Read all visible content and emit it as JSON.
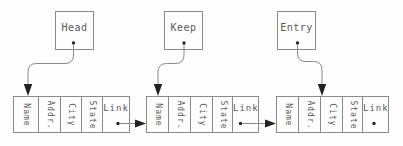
{
  "diagram": {
    "pointers": [
      {
        "label": "Head"
      },
      {
        "label": "Keep"
      },
      {
        "label": "Entry"
      }
    ],
    "nodes": [
      {
        "fields": [
          "Name",
          "Addr.",
          "City",
          "State",
          "Link"
        ]
      },
      {
        "fields": [
          "Name",
          "Addr.",
          "City",
          "State",
          "Link"
        ]
      },
      {
        "fields": [
          "Name",
          "Addr.",
          "City",
          "State",
          "Link"
        ]
      }
    ],
    "colors": {
      "line": "#8a8a8a",
      "text": "#5a5a5a",
      "marker": "#222222",
      "background": "#fdfdfd"
    }
  }
}
